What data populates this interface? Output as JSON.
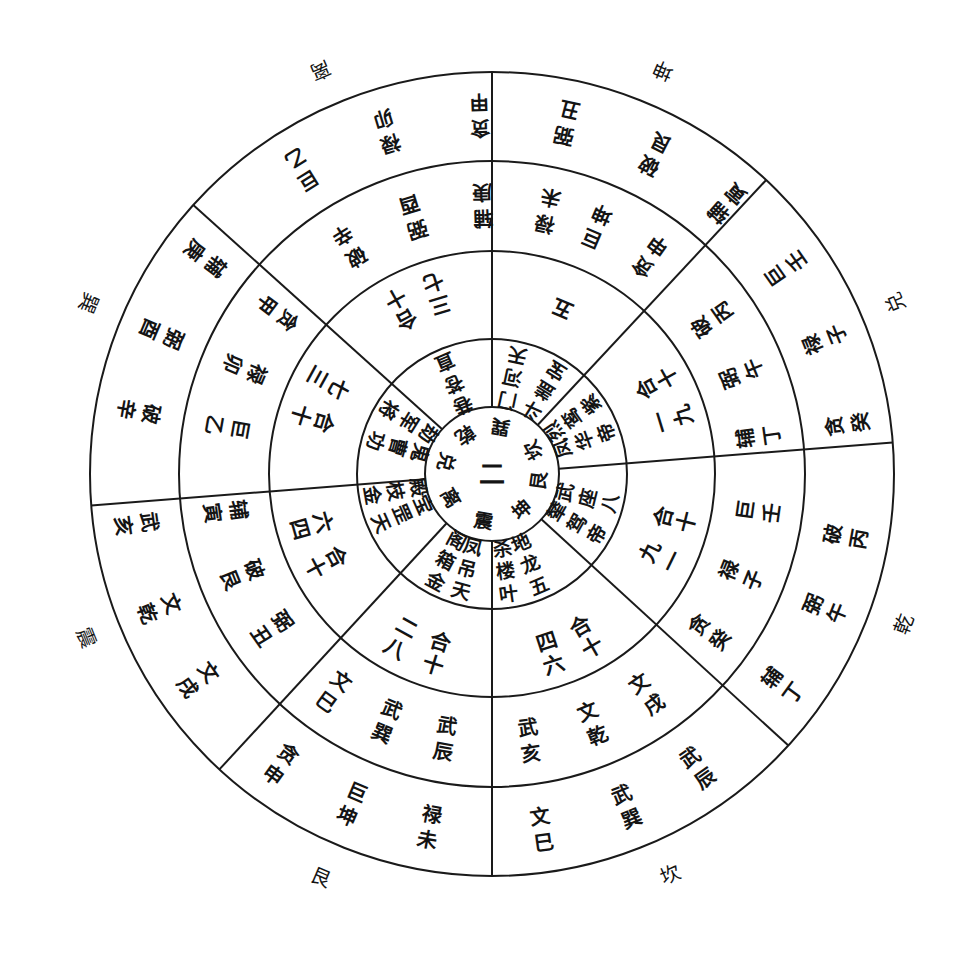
{
  "diagram": {
    "type": "concentric-compass-wheel",
    "center_numeral": "二",
    "colors": {
      "line": "#1a1a1a",
      "text": "#141414",
      "background": "#ffffff"
    },
    "core_trigrams": [
      {
        "label": "坎",
        "angle": -30
      },
      {
        "label": "艮",
        "angle": 8
      },
      {
        "label": "坤",
        "angle": 50
      },
      {
        "label": "震",
        "angle": 100
      },
      {
        "label": "离",
        "angle": 150
      },
      {
        "label": "兑",
        "angle": 195
      },
      {
        "label": "乾",
        "angle": 235
      },
      {
        "label": "巽",
        "angle": 280
      }
    ],
    "outer_directions": [
      {
        "label": "离",
        "angle": 247
      },
      {
        "label": "坤",
        "angle": 293
      },
      {
        "label": "兑",
        "angle": 337
      },
      {
        "label": "乾",
        "angle": 20
      },
      {
        "label": "坎",
        "angle": 66
      },
      {
        "label": "艮",
        "angle": 113
      },
      {
        "label": "震",
        "angle": 158
      },
      {
        "label": "巽",
        "angle": 203
      }
    ],
    "ring1_stars": [
      {
        "angle": 247,
        "lines": [
          "直",
          "苍",
          "巷"
        ]
      },
      {
        "angle": 282,
        "lines": [
          "天",
          "河",
          "门"
        ]
      },
      {
        "angle": 302,
        "lines": [
          "宝",
          "盖",
          "斗"
        ]
      },
      {
        "angle": 325,
        "lines": [
          "紫",
          "鸾",
          "烈"
        ]
      },
      {
        "angle": 340,
        "lines": [
          "帝",
          "华",
          "凤"
        ]
      },
      {
        "angle": 14,
        "lines": [
          "八",
          "座",
          "武"
        ]
      },
      {
        "angle": 30,
        "lines": [
          "帝",
          "驾",
          "辇"
        ]
      },
      {
        "angle": 67,
        "lines": [
          "五",
          "龙",
          "地"
        ]
      },
      {
        "angle": 82,
        "lines": [
          "叶",
          "楼",
          "杀"
        ]
      },
      {
        "angle": 105,
        "lines": [
          "天",
          "吊",
          "凤"
        ]
      },
      {
        "angle": 118,
        "lines": [
          "金",
          "箱",
          "阁"
        ]
      },
      {
        "angle": 156,
        "lines": [
          "天",
          "罡",
          "宝"
        ]
      },
      {
        "angle": 170,
        "lines": [
          "金",
          "枝",
          "殿"
        ]
      },
      {
        "angle": 196,
        "lines": [
          "功",
          "曹",
          "鬼"
        ]
      },
      {
        "angle": 212,
        "lines": [
          "将",
          "军",
          "劫"
        ]
      }
    ],
    "ring2_numbers": [
      {
        "label": "七三十合",
        "angle": 247
      },
      {
        "label": "五",
        "angle": 293
      },
      {
        "label": "九一十合",
        "angle": 337
      },
      {
        "label": "一九十合",
        "angle": 20
      },
      {
        "label": "六四十合",
        "angle": 66
      },
      {
        "label": "八二十合",
        "angle": 113
      },
      {
        "label": "四六十合",
        "angle": 158
      },
      {
        "label": "三七十合",
        "angle": 203
      }
    ],
    "ring3_stems": [
      {
        "label": "辛破",
        "angle": 238
      },
      {
        "label": "酉弼",
        "angle": 253
      },
      {
        "label": "庚辅",
        "angle": 268
      },
      {
        "label": "未禄",
        "angle": 282
      },
      {
        "label": "坤巨",
        "angle": 293
      },
      {
        "label": "申贪",
        "angle": 306
      },
      {
        "label": "丙破",
        "angle": 325
      },
      {
        "label": "午弼",
        "angle": 338
      },
      {
        "label": "丁辅",
        "angle": 352
      },
      {
        "label": "壬巨",
        "angle": 8
      },
      {
        "label": "子禄",
        "angle": 22
      },
      {
        "label": "癸贪",
        "angle": 36
      },
      {
        "label": "戌文",
        "angle": 55
      },
      {
        "label": "乾文",
        "angle": 68
      },
      {
        "label": "亥武",
        "angle": 82
      },
      {
        "label": "辰武",
        "angle": 100
      },
      {
        "label": "巽武",
        "angle": 113
      },
      {
        "label": "巳文",
        "angle": 126
      },
      {
        "label": "丑弼",
        "angle": 145
      },
      {
        "label": "艮破",
        "angle": 158
      },
      {
        "label": "寅辅",
        "angle": 172
      },
      {
        "label": "乙巨",
        "angle": 190
      },
      {
        "label": "卯禄",
        "angle": 203
      },
      {
        "label": "甲贪",
        "angle": 217
      }
    ],
    "ring4_stems": [
      {
        "label": "乙巨",
        "angle": 238
      },
      {
        "label": "卯禄",
        "angle": 253
      },
      {
        "label": "甲贪",
        "angle": 268
      },
      {
        "label": "丑弼",
        "angle": 282
      },
      {
        "label": "艮破",
        "angle": 297
      },
      {
        "label": "寅辅",
        "angle": 311
      },
      {
        "label": "壬巨",
        "angle": 325
      },
      {
        "label": "子禄",
        "angle": 338
      },
      {
        "label": "癸贪",
        "angle": 352
      },
      {
        "label": "丙破",
        "angle": 10
      },
      {
        "label": "午弼",
        "angle": 22
      },
      {
        "label": "丁辅",
        "angle": 36
      },
      {
        "label": "辰武",
        "angle": 55
      },
      {
        "label": "巽武",
        "angle": 68
      },
      {
        "label": "巳文",
        "angle": 82
      },
      {
        "label": "未禄",
        "angle": 100
      },
      {
        "label": "坤巨",
        "angle": 113
      },
      {
        "label": "申贪",
        "angle": 126
      },
      {
        "label": "戌文",
        "angle": 145
      },
      {
        "label": "乾文",
        "angle": 158
      },
      {
        "label": "亥武",
        "angle": 172
      },
      {
        "label": "辛破",
        "angle": 190
      },
      {
        "label": "酉弼",
        "angle": 203
      },
      {
        "label": "庚辅",
        "angle": 217
      }
    ]
  }
}
